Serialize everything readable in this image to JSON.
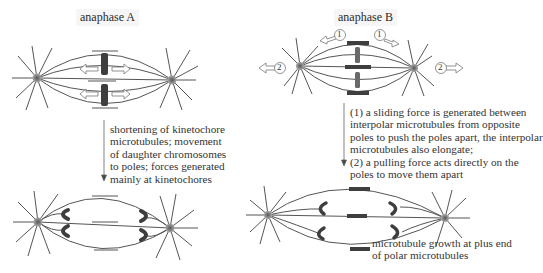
{
  "panels": {
    "anaphase_a": {
      "title": "anaphase A",
      "caption_lines": [
        "shortening of kinetochore",
        "microtubules; movement",
        "of daughter chromosomes",
        "to poles; forces generated",
        "mainly at kinetochores"
      ]
    },
    "anaphase_b": {
      "title": "anaphase B",
      "caption_lines": [
        "(1) a sliding force is generated between",
        "interpolar microtubules from opposite",
        "poles to push the poles apart, the interpolar",
        "microtubules also elongate;",
        "(2) a pulling force acts directly on the",
        "poles to move them apart"
      ],
      "force_labels": [
        "1",
        "1",
        "2",
        "2"
      ],
      "growth_label_lines": [
        "microtubule growth at plus end",
        "of polar microtubules"
      ]
    }
  },
  "colors": {
    "line": "#555555",
    "chromosome": "#444444",
    "pole": "#8a8a8a",
    "text": "#333333"
  }
}
